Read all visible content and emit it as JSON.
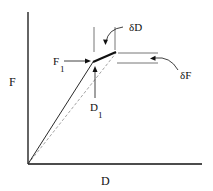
{
  "diagram": {
    "type": "force-displacement curve",
    "axes": {
      "x_label": "D",
      "y_label": "F"
    },
    "annotations": {
      "f1_label": "F",
      "f1_sub": "1",
      "d1_label": "D",
      "d1_sub": "1",
      "delta_d_label": "δD",
      "delta_f_label": "δF"
    },
    "colors": {
      "line": "#111111",
      "dashed": "#999999"
    }
  }
}
